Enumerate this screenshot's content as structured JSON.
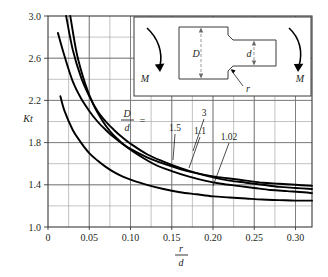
{
  "figure": {
    "title": "Stress concentration factor chart for a round shaft with shoulder fillet in bending",
    "y_axis_label": "Kt",
    "x_axis_label_numerator": "r",
    "x_axis_label_denominator": "d",
    "curve_family_label_numerator": "D",
    "curve_family_label_denominator": "d",
    "curve_family_label_equals": "=",
    "background_color": "#ffffff",
    "curve_color": "#000000",
    "grid_color": "#6f6f6f",
    "frame_color": "#3a3a3a"
  },
  "inset": {
    "name": "stepped-shaft-in-bending",
    "label_D": "D",
    "label_d": "d",
    "label_r": "r",
    "label_M_left": "M",
    "label_M_right": "M"
  },
  "chart_data": {
    "type": "line",
    "title": "",
    "xlabel": "r/d",
    "ylabel": "Kt",
    "xlim": [
      0,
      0.32
    ],
    "ylim": [
      1.0,
      3.0
    ],
    "xticks": [
      0,
      0.05,
      0.1,
      0.15,
      0.2,
      0.25,
      0.3
    ],
    "xticklabels": [
      "0",
      "0.05",
      "0.10",
      "0.15",
      "0.20",
      "0.25",
      "0.30"
    ],
    "yticks": [
      1.0,
      1.4,
      1.8,
      2.2,
      2.6,
      3.0
    ],
    "yticklabels": [
      "1.0",
      "1.4",
      "1.8",
      "2.2",
      "2.6",
      "3.0"
    ],
    "x_minor_step": 0.025,
    "y_minor_step": 0.2,
    "grid": true,
    "legend": "inline-curve-labels",
    "series": [
      {
        "name": "3",
        "label": "3",
        "x": [
          0.012,
          0.02,
          0.03,
          0.04,
          0.05,
          0.06,
          0.07,
          0.08,
          0.09,
          0.1,
          0.12,
          0.14,
          0.16,
          0.18,
          0.2,
          0.22,
          0.24,
          0.26,
          0.28,
          0.3,
          0.32
        ],
        "y": [
          2.84,
          2.62,
          2.38,
          2.22,
          2.1,
          2.0,
          1.92,
          1.85,
          1.79,
          1.74,
          1.66,
          1.6,
          1.55,
          1.51,
          1.48,
          1.46,
          1.44,
          1.42,
          1.41,
          1.4,
          1.39
        ]
      },
      {
        "name": "1.5",
        "label": "1.5",
        "x": [
          0.022,
          0.03,
          0.04,
          0.05,
          0.06,
          0.07,
          0.08,
          0.09,
          0.1,
          0.12,
          0.14,
          0.16,
          0.18,
          0.2,
          0.22,
          0.24,
          0.26,
          0.28,
          0.3,
          0.32
        ],
        "y": [
          3.0,
          2.68,
          2.42,
          2.24,
          2.1,
          2.0,
          1.92,
          1.85,
          1.79,
          1.69,
          1.62,
          1.56,
          1.51,
          1.47,
          1.44,
          1.42,
          1.4,
          1.38,
          1.37,
          1.36
        ]
      },
      {
        "name": "1.1",
        "label": "1.1",
        "x": [
          0.027,
          0.035,
          0.045,
          0.055,
          0.065,
          0.075,
          0.085,
          0.095,
          0.11,
          0.13,
          0.15,
          0.17,
          0.19,
          0.21,
          0.23,
          0.25,
          0.27,
          0.29,
          0.31,
          0.32
        ],
        "y": [
          3.0,
          2.64,
          2.36,
          2.16,
          2.02,
          1.91,
          1.83,
          1.76,
          1.68,
          1.59,
          1.53,
          1.48,
          1.44,
          1.41,
          1.39,
          1.37,
          1.35,
          1.34,
          1.33,
          1.32
        ]
      },
      {
        "name": "1.02",
        "label": "1.02",
        "x": [
          0.015,
          0.02,
          0.03,
          0.04,
          0.05,
          0.06,
          0.07,
          0.08,
          0.09,
          0.1,
          0.12,
          0.14,
          0.16,
          0.18,
          0.2,
          0.22,
          0.24,
          0.26,
          0.28,
          0.3,
          0.32
        ],
        "y": [
          2.24,
          2.1,
          1.92,
          1.8,
          1.7,
          1.63,
          1.57,
          1.52,
          1.48,
          1.45,
          1.4,
          1.36,
          1.33,
          1.31,
          1.29,
          1.28,
          1.27,
          1.26,
          1.255,
          1.25,
          1.25
        ]
      }
    ],
    "curve_labels": [
      {
        "text": "3",
        "x_px": 204,
        "y_px": 116,
        "leader_to_x": 193,
        "leader_to_y": 151
      },
      {
        "text": "1.5",
        "x_px": 175,
        "y_px": 131,
        "leader_to_x": 173,
        "leader_to_y": 160
      },
      {
        "text": "1.1",
        "x_px": 200,
        "y_px": 134,
        "leader_to_x": 189,
        "leader_to_y": 168
      },
      {
        "text": "1.02",
        "x_px": 229,
        "y_px": 140,
        "leader_to_x": 213,
        "leader_to_y": 186
      }
    ]
  }
}
